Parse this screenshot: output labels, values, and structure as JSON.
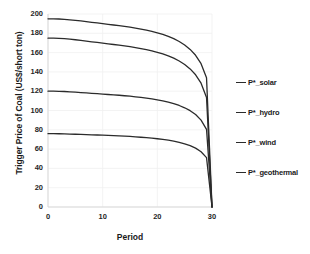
{
  "chart_data": {
    "type": "line",
    "title": "",
    "xlabel": "Period",
    "ylabel": "Trigger Price of Coal (US$/short ton)",
    "xlim": [
      0,
      30
    ],
    "ylim": [
      0,
      200
    ],
    "xticks": [
      "0",
      "10",
      "20",
      "30"
    ],
    "xtick_values": [
      0,
      10,
      20,
      30
    ],
    "yticks": [
      "0",
      "20",
      "40",
      "60",
      "80",
      "100",
      "120",
      "140",
      "160",
      "180",
      "200"
    ],
    "ytick_values": [
      0,
      20,
      40,
      60,
      80,
      100,
      120,
      140,
      160,
      180,
      200
    ],
    "grid": "light vertical and horizontal gridlines",
    "legend_position": "right",
    "line_color": "#2b2b2b",
    "x": [
      0,
      1,
      2,
      3,
      4,
      5,
      6,
      7,
      8,
      9,
      10,
      11,
      12,
      13,
      14,
      15,
      16,
      17,
      18,
      19,
      20,
      21,
      22,
      23,
      24,
      25,
      26,
      27,
      28,
      29,
      30
    ],
    "series": [
      {
        "name": "P*_solar",
        "values": [
          195.0,
          195.0,
          194.8,
          194.5,
          194.0,
          193.4,
          192.8,
          192.1,
          191.4,
          190.7,
          190.0,
          189.3,
          188.6,
          187.9,
          187.1,
          186.3,
          185.4,
          184.4,
          183.3,
          182.0,
          180.5,
          178.8,
          176.8,
          174.4,
          171.5,
          167.9,
          163.3,
          157.2,
          148.5,
          134.0,
          0.0
        ]
      },
      {
        "name": "P*_hydro",
        "values": [
          175.0,
          175.0,
          174.8,
          174.4,
          173.9,
          173.3,
          172.6,
          171.9,
          171.2,
          170.5,
          169.8,
          169.1,
          168.4,
          167.7,
          166.9,
          166.1,
          165.2,
          164.2,
          163.1,
          161.8,
          160.3,
          158.6,
          156.6,
          154.2,
          151.3,
          147.7,
          143.1,
          137.0,
          128.3,
          113.5,
          0.0
        ]
      },
      {
        "name": "P*_wind",
        "values": [
          120.0,
          120.0,
          119.9,
          119.7,
          119.4,
          119.0,
          118.6,
          118.2,
          117.8,
          117.4,
          117.0,
          116.6,
          116.2,
          115.8,
          115.3,
          114.8,
          114.2,
          113.5,
          112.8,
          112.0,
          111.0,
          109.9,
          108.6,
          107.1,
          105.2,
          102.8,
          99.8,
          95.8,
          90.0,
          80.5,
          0.0
        ]
      },
      {
        "name": "P*_geothermal",
        "values": [
          76.0,
          76.0,
          75.9,
          75.8,
          75.6,
          75.4,
          75.2,
          75.0,
          74.8,
          74.6,
          74.4,
          74.2,
          74.0,
          73.7,
          73.4,
          73.1,
          72.7,
          72.3,
          71.8,
          71.3,
          70.7,
          70.0,
          69.2,
          68.2,
          67.0,
          65.5,
          63.6,
          61.0,
          57.3,
          51.2,
          0.0
        ]
      }
    ]
  },
  "legend": {
    "items": [
      {
        "label": "P*_solar"
      },
      {
        "label": "P*_hydro"
      },
      {
        "label": "P*_wind"
      },
      {
        "label": "P*_geothermal"
      }
    ]
  }
}
